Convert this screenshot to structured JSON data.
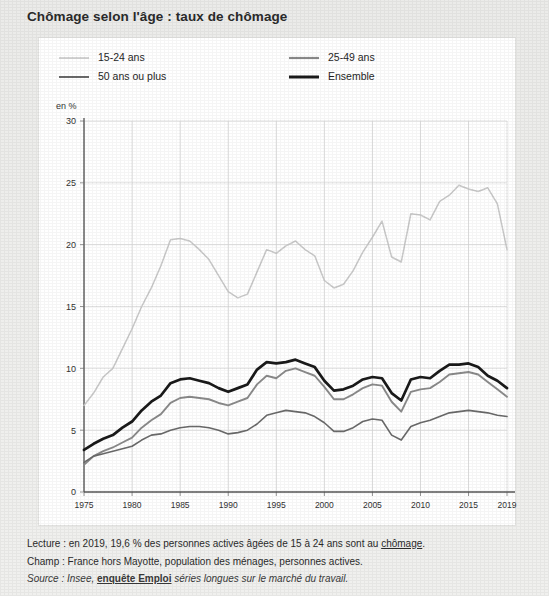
{
  "title": "Chômage selon l'âge : taux de chômage",
  "legend": [
    {
      "label": "15-24 ans",
      "color": "#c9c9c9",
      "width": 1.6
    },
    {
      "label": "25-49 ans",
      "color": "#8a8a8a",
      "width": 2.0
    },
    {
      "label": "50 ans ou plus",
      "color": "#6a6a6a",
      "width": 1.8
    },
    {
      "label": "Ensemble",
      "color": "#1a1a1a",
      "width": 2.6
    }
  ],
  "axis_unit": "en %",
  "notes": {
    "lecture_prefix": "Lecture : en 2019, 19,6 % des personnes actives âgées de 15 à 24 ans sont au ",
    "lecture_link": "chômage",
    "lecture_suffix": ".",
    "champ": "Champ : France hors Mayotte, population des ménages, personnes actives.",
    "source_prefix": "Source : Insee, ",
    "source_bold": "enquête Emploi",
    "source_suffix": " séries longues sur le marché du travail."
  },
  "chart_data": {
    "type": "line",
    "title": "Chômage selon l'âge : taux de chômage",
    "xlabel": "",
    "ylabel": "en %",
    "ylim": [
      0,
      30
    ],
    "xlim": [
      1975,
      2019
    ],
    "yticks": [
      0,
      5,
      10,
      15,
      20,
      25,
      30
    ],
    "xticks": [
      1975,
      1980,
      1985,
      1990,
      1995,
      2000,
      2005,
      2010,
      2015,
      2019
    ],
    "grid": true,
    "legend_position": "top",
    "x": [
      1975,
      1976,
      1977,
      1978,
      1979,
      1980,
      1981,
      1982,
      1983,
      1984,
      1985,
      1986,
      1987,
      1988,
      1989,
      1990,
      1991,
      1992,
      1993,
      1994,
      1995,
      1996,
      1997,
      1998,
      1999,
      2000,
      2001,
      2002,
      2003,
      2004,
      2005,
      2006,
      2007,
      2008,
      2009,
      2010,
      2011,
      2012,
      2013,
      2014,
      2015,
      2016,
      2017,
      2018,
      2019
    ],
    "series": [
      {
        "name": "15-24 ans",
        "color": "#c9c9c9",
        "values": [
          7.0,
          8.0,
          9.3,
          10.0,
          11.6,
          13.2,
          15.0,
          16.5,
          18.3,
          20.4,
          20.5,
          20.3,
          19.6,
          18.8,
          17.5,
          16.2,
          15.7,
          16.0,
          17.8,
          19.6,
          19.3,
          19.9,
          20.3,
          19.6,
          19.1,
          17.1,
          16.5,
          16.8,
          17.9,
          19.4,
          20.6,
          21.9,
          19.0,
          18.6,
          22.5,
          22.4,
          22.0,
          23.5,
          24.0,
          24.8,
          24.5,
          24.3,
          24.6,
          23.3,
          19.6
        ]
      },
      {
        "name": "25-49 ans",
        "color": "#8a8a8a",
        "values": [
          2.2,
          2.9,
          3.3,
          3.6,
          4.0,
          4.4,
          5.2,
          5.8,
          6.3,
          7.2,
          7.6,
          7.7,
          7.6,
          7.5,
          7.2,
          7.0,
          7.3,
          7.6,
          8.7,
          9.4,
          9.2,
          9.8,
          10.0,
          9.7,
          9.4,
          8.5,
          7.5,
          7.5,
          7.9,
          8.4,
          8.7,
          8.6,
          7.3,
          6.5,
          8.1,
          8.3,
          8.4,
          8.9,
          9.5,
          9.6,
          9.7,
          9.5,
          8.9,
          8.3,
          7.7
        ]
      },
      {
        "name": "50 ans ou plus",
        "color": "#6a6a6a",
        "values": [
          2.4,
          2.9,
          3.1,
          3.3,
          3.5,
          3.7,
          4.2,
          4.6,
          4.7,
          5.0,
          5.2,
          5.3,
          5.3,
          5.2,
          5.0,
          4.7,
          4.8,
          5.0,
          5.5,
          6.2,
          6.4,
          6.6,
          6.5,
          6.4,
          6.1,
          5.6,
          4.9,
          4.9,
          5.2,
          5.7,
          5.9,
          5.8,
          4.6,
          4.2,
          5.3,
          5.6,
          5.8,
          6.1,
          6.4,
          6.5,
          6.6,
          6.5,
          6.4,
          6.2,
          6.1
        ]
      },
      {
        "name": "Ensemble",
        "color": "#1a1a1a",
        "values": [
          3.4,
          3.9,
          4.3,
          4.6,
          5.2,
          5.7,
          6.6,
          7.3,
          7.8,
          8.8,
          9.1,
          9.2,
          9.0,
          8.8,
          8.4,
          8.1,
          8.4,
          8.7,
          9.9,
          10.5,
          10.4,
          10.5,
          10.7,
          10.4,
          10.1,
          9.0,
          8.2,
          8.3,
          8.6,
          9.1,
          9.3,
          9.2,
          8.0,
          7.4,
          9.1,
          9.3,
          9.2,
          9.8,
          10.3,
          10.3,
          10.4,
          10.1,
          9.4,
          9.0,
          8.4
        ]
      }
    ]
  }
}
